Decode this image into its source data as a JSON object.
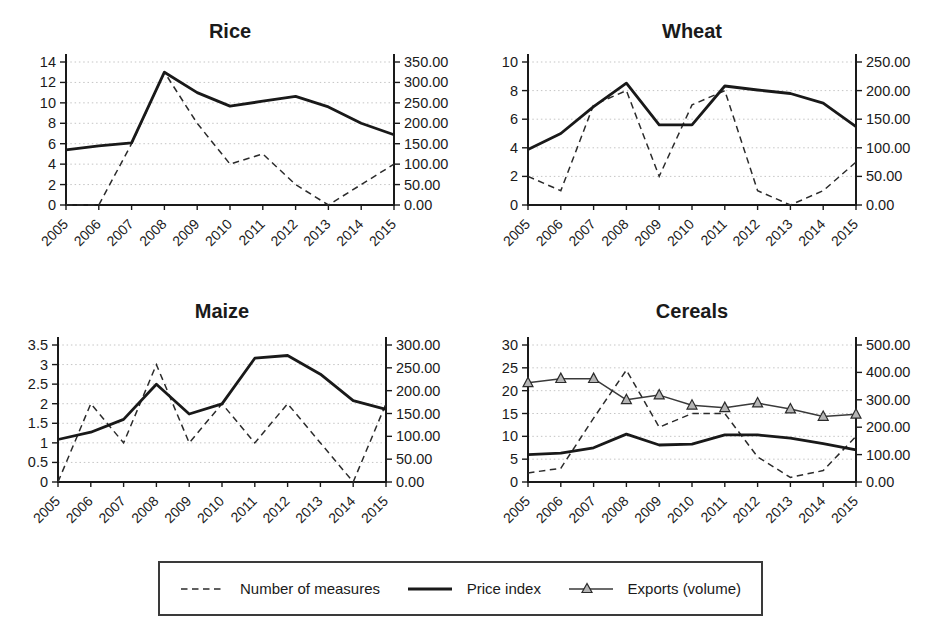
{
  "figure": {
    "background": "#ffffff"
  },
  "colors": {
    "line": "#1a1a1a",
    "grid": "#c5c5c5",
    "marker_fill": "#b5b5b5",
    "background": "#ffffff"
  },
  "legend": {
    "items": [
      {
        "label": "Number of measures",
        "style": "dashed"
      },
      {
        "label": "Price index",
        "style": "solid"
      },
      {
        "label": "Exports (volume)",
        "style": "marker"
      }
    ]
  },
  "chart_data": [
    {
      "type": "line",
      "title": "Rice",
      "x": [
        "2005",
        "2006",
        "2007",
        "2008",
        "2009",
        "2010",
        "2011",
        "2012",
        "2013",
        "2014",
        "2015"
      ],
      "left_axis": {
        "range": [
          0,
          14
        ],
        "ticks": [
          "0",
          "2",
          "4",
          "6",
          "8",
          "10",
          "12",
          "14"
        ],
        "grid": true
      },
      "right_axis": {
        "range": [
          0,
          350
        ],
        "ticks": [
          "0.00",
          "50.00",
          "100.00",
          "150.00",
          "200.00",
          "250.00",
          "300.00",
          "350.00"
        ]
      },
      "series": [
        {
          "name": "Number of measures",
          "axis": "left",
          "style": "dashed",
          "values": [
            0,
            0,
            6,
            13,
            8,
            4,
            5,
            2,
            0,
            2,
            4
          ]
        },
        {
          "name": "Price index",
          "axis": "right",
          "style": "solid",
          "values": [
            135,
            145,
            152,
            325,
            275,
            242,
            254,
            266,
            240,
            200,
            172
          ]
        }
      ]
    },
    {
      "type": "line",
      "title": "Wheat",
      "x": [
        "2005",
        "2006",
        "2007",
        "2008",
        "2009",
        "2010",
        "2011",
        "2012",
        "2013",
        "2014",
        "2015"
      ],
      "left_axis": {
        "range": [
          0,
          10
        ],
        "ticks": [
          "0",
          "2",
          "4",
          "6",
          "8",
          "10"
        ],
        "grid": true
      },
      "right_axis": {
        "range": [
          0,
          250
        ],
        "ticks": [
          "0.00",
          "50.00",
          "100.00",
          "150.00",
          "200.00",
          "250.00"
        ]
      },
      "series": [
        {
          "name": "Number of measures",
          "axis": "left",
          "style": "dashed",
          "values": [
            2,
            1,
            7,
            8,
            2,
            7,
            8,
            1,
            0,
            1,
            3
          ]
        },
        {
          "name": "Price index",
          "axis": "right",
          "style": "solid",
          "values": [
            97,
            125,
            172,
            213,
            140,
            140,
            208,
            201,
            195,
            178,
            137
          ]
        }
      ]
    },
    {
      "type": "line",
      "title": "Maize",
      "x": [
        "2005",
        "2006",
        "2007",
        "2008",
        "2009",
        "2010",
        "2011",
        "2012",
        "2013",
        "2014",
        "2015"
      ],
      "left_axis": {
        "range": [
          0,
          3.5
        ],
        "ticks": [
          "0",
          "0.5",
          "1",
          "1.5",
          "2",
          "2.5",
          "3",
          "3.5"
        ],
        "grid": true
      },
      "right_axis": {
        "range": [
          0,
          300
        ],
        "ticks": [
          "0.00",
          "50.00",
          "100.00",
          "150.00",
          "200.00",
          "250.00",
          "300.00"
        ]
      },
      "series": [
        {
          "name": "Number of measures",
          "axis": "left",
          "style": "dashed",
          "values": [
            0,
            2,
            1,
            3,
            1,
            2,
            1,
            2,
            1,
            0,
            2
          ]
        },
        {
          "name": "Price index",
          "axis": "right",
          "style": "solid",
          "values": [
            93,
            109,
            137,
            214,
            149,
            171,
            271,
            277,
            236,
            178,
            159
          ]
        }
      ]
    },
    {
      "type": "line",
      "title": "Cereals",
      "x": [
        "2005",
        "2006",
        "2007",
        "2008",
        "2009",
        "2010",
        "2011",
        "2012",
        "2013",
        "2014",
        "2015"
      ],
      "left_axis": {
        "range": [
          0,
          30
        ],
        "ticks": [
          "0",
          "5",
          "10",
          "15",
          "20",
          "25",
          "30"
        ],
        "grid": true
      },
      "right_axis": {
        "range": [
          0,
          500
        ],
        "ticks": [
          "0.00",
          "100.00",
          "200.00",
          "300.00",
          "400.00",
          "500.00"
        ]
      },
      "series": [
        {
          "name": "Number of measures",
          "axis": "left",
          "style": "dashed",
          "values": [
            2,
            3,
            14,
            24.5,
            12,
            15,
            15,
            5.5,
            1,
            2.5,
            10
          ]
        },
        {
          "name": "Price index",
          "axis": "right",
          "style": "solid",
          "values": [
            100,
            105,
            125,
            175,
            135,
            138,
            172,
            172,
            160,
            140,
            117
          ]
        },
        {
          "name": "Exports (volume)",
          "axis": "right",
          "style": "marker",
          "values": [
            362,
            377,
            377,
            300,
            317,
            280,
            271,
            288,
            266,
            239,
            247
          ]
        }
      ]
    }
  ]
}
